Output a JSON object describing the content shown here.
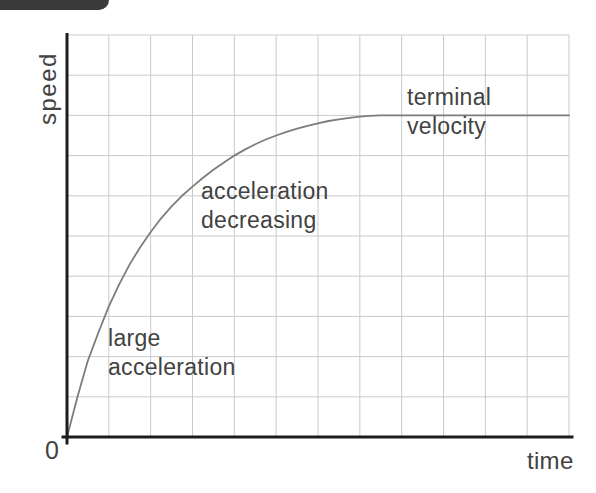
{
  "page": {
    "corner_tab_color": "#3a3a3a",
    "background_color": "#ffffff"
  },
  "chart_data": {
    "type": "line",
    "title": "",
    "xlabel": "time",
    "ylabel": "speed",
    "origin_label": "0",
    "grid": true,
    "legend": false,
    "x_range": [
      0,
      12
    ],
    "y_range": [
      0,
      10
    ],
    "terminal_velocity_level": 8,
    "axis_color": "#1d1d1d",
    "grid_color": "#c9cacd",
    "curve_color": "#7d7d7d",
    "text_color": "#424242",
    "series": [
      {
        "name": "speed of falling object",
        "points": [
          [
            0,
            0
          ],
          [
            0.25,
            1.0
          ],
          [
            0.5,
            1.9
          ],
          [
            0.75,
            2.6
          ],
          [
            1,
            3.25
          ],
          [
            1.25,
            3.8
          ],
          [
            1.5,
            4.3
          ],
          [
            1.75,
            4.72
          ],
          [
            2,
            5.1
          ],
          [
            2.25,
            5.44
          ],
          [
            2.5,
            5.74
          ],
          [
            2.75,
            6.0
          ],
          [
            3,
            6.23
          ],
          [
            3.25,
            6.45
          ],
          [
            3.5,
            6.65
          ],
          [
            3.75,
            6.83
          ],
          [
            4,
            7.0
          ],
          [
            4.25,
            7.15
          ],
          [
            4.5,
            7.28
          ],
          [
            4.75,
            7.4
          ],
          [
            5,
            7.5
          ],
          [
            5.25,
            7.59
          ],
          [
            5.5,
            7.67
          ],
          [
            5.75,
            7.74
          ],
          [
            6,
            7.8
          ],
          [
            6.25,
            7.86
          ],
          [
            6.5,
            7.9
          ],
          [
            6.75,
            7.94
          ],
          [
            7,
            7.97
          ],
          [
            7.25,
            7.99
          ],
          [
            7.5,
            8
          ],
          [
            8,
            8
          ],
          [
            9,
            8
          ],
          [
            10,
            8
          ],
          [
            11,
            8
          ],
          [
            12,
            8
          ]
        ]
      }
    ]
  },
  "annotations": {
    "large_acceleration": {
      "line1": "large",
      "line2": "acceleration"
    },
    "acceleration_decreasing": {
      "line1": "acceleration",
      "line2": "decreasing"
    },
    "terminal_velocity": {
      "line1": "terminal",
      "line2": "velocity"
    }
  }
}
